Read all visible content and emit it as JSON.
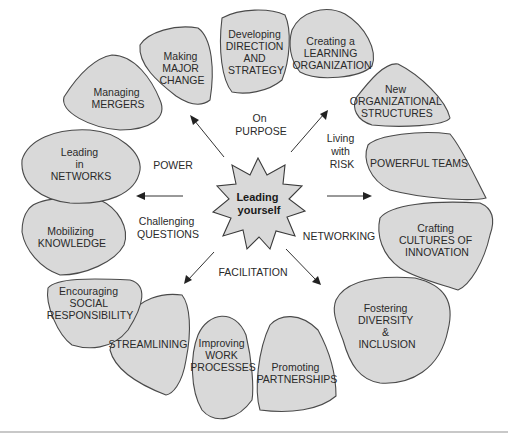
{
  "center": {
    "lines": [
      "Leading",
      "yourself"
    ]
  },
  "themes": [
    {
      "id": "on-purpose",
      "lines": [
        "On",
        "PURPOSE"
      ]
    },
    {
      "id": "living-with-risk",
      "lines": [
        "Living",
        "with",
        "RISK"
      ]
    },
    {
      "id": "power",
      "lines": [
        "POWER"
      ]
    },
    {
      "id": "challenging-questions",
      "lines": [
        "Challenging",
        "QUESTIONS"
      ]
    },
    {
      "id": "networking",
      "lines": [
        "NETWORKING"
      ]
    },
    {
      "id": "facilitation",
      "lines": [
        "FACILITATION"
      ]
    }
  ],
  "nodes": [
    {
      "id": "managing-mergers",
      "lines": [
        "Managing",
        "MERGERS"
      ]
    },
    {
      "id": "making-major-change",
      "lines": [
        "Making",
        "MAJOR",
        "CHANGE"
      ]
    },
    {
      "id": "developing-direction",
      "lines": [
        "Developing",
        "DIRECTION",
        "AND",
        "STRATEGY"
      ]
    },
    {
      "id": "learning-organization",
      "lines": [
        "Creating a",
        "LEARNING",
        "ORGANIZATION"
      ]
    },
    {
      "id": "new-structures",
      "lines": [
        "New",
        "ORGANIZATIONAL",
        "STRUCTURES"
      ]
    },
    {
      "id": "powerful-teams",
      "lines": [
        "POWERFUL TEAMS"
      ]
    },
    {
      "id": "cultures-of-innovation",
      "lines": [
        "Crafting",
        "CULTURES OF",
        "INNOVATION"
      ]
    },
    {
      "id": "diversity-inclusion",
      "lines": [
        "Fostering",
        "DIVERSITY",
        "&",
        "INCLUSION"
      ]
    },
    {
      "id": "partnerships",
      "lines": [
        "Promoting",
        "PARTNERSHIPS"
      ]
    },
    {
      "id": "work-processes",
      "lines": [
        "Improving",
        "WORK",
        "PROCESSES"
      ]
    },
    {
      "id": "streamlining",
      "lines": [
        "STREAMLINING"
      ]
    },
    {
      "id": "social-responsibility",
      "lines": [
        "Encouraging",
        "SOCIAL",
        "RESPONSIBILITY"
      ]
    },
    {
      "id": "mobilizing-knowledge",
      "lines": [
        "Mobilizing",
        "KNOWLEDGE"
      ]
    },
    {
      "id": "leading-networks",
      "lines": [
        "Leading",
        "in",
        "NETWORKS"
      ]
    }
  ]
}
